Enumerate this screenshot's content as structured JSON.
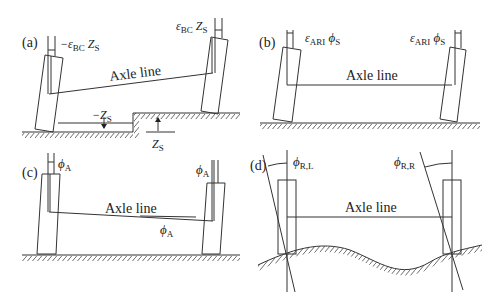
{
  "figure": {
    "panels": [
      {
        "id": "a",
        "label": "(a)",
        "axle_label": "Axle line",
        "left_annotation": {
          "prefix": "−ε",
          "sub": "BC",
          "main": " Z",
          "sub2": "S"
        },
        "right_annotation": {
          "prefix": "ε",
          "sub": "BC",
          "main": " Z",
          "sub2": "S"
        },
        "step_down_label": {
          "prefix": "−Z",
          "sub": "S"
        },
        "step_up_label": {
          "prefix": "Z",
          "sub": "S"
        }
      },
      {
        "id": "b",
        "label": "(b)",
        "axle_label": "Axle line",
        "left_annotation": {
          "prefix": "ε",
          "sub": "ARI",
          "main": " ϕ",
          "sub2": "S"
        },
        "right_annotation": {
          "prefix": "ε",
          "sub": "ARI",
          "main": " ϕ",
          "sub2": "S"
        }
      },
      {
        "id": "c",
        "label": "(c)",
        "axle_label": "Axle line",
        "left_annotation": {
          "main": "ϕ",
          "sub2": "A"
        },
        "right_annotation": {
          "main": "ϕ",
          "sub2": "A"
        },
        "axle_angle_label": {
          "main": "ϕ",
          "sub2": "A"
        }
      },
      {
        "id": "d",
        "label": "(d)",
        "axle_label": "Axle line",
        "left_annotation": {
          "main": "ϕ",
          "sub2": "R,L"
        },
        "right_annotation": {
          "main": "ϕ",
          "sub2": "R,R"
        }
      }
    ]
  }
}
